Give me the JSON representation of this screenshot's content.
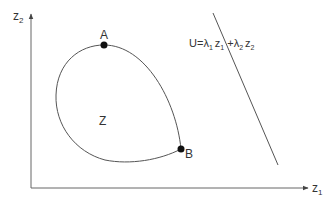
{
  "diagram": {
    "axes": {
      "x_label": "z",
      "x_sub": "1",
      "y_label": "z",
      "y_sub": "2"
    },
    "region_label": "Z",
    "points": [
      {
        "label": "A",
        "description": "top point of region Z"
      },
      {
        "label": "B",
        "description": "point of region Z touching lower-right"
      }
    ],
    "line_label": {
      "U": "U",
      "eq": "=",
      "lambda": "λ",
      "sub1": "1",
      "z": "z",
      "plus": "+",
      "sub2": "2"
    },
    "colors": {
      "stroke": "#555555",
      "point": "#111111",
      "text": "#333333"
    }
  }
}
